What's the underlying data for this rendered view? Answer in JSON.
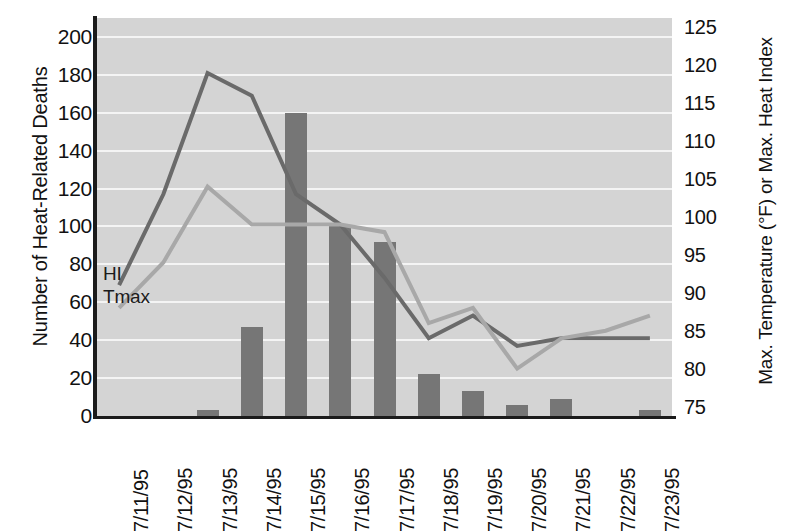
{
  "chart_data": {
    "type": "bar",
    "title": "",
    "categories": [
      "7/11/95",
      "7/12/95",
      "7/13/95",
      "7/14/95",
      "7/15/95",
      "7/16/95",
      "7/17/95",
      "7/18/95",
      "7/19/95",
      "7/20/95",
      "7/21/95",
      "7/22/95",
      "7/23/95"
    ],
    "xlabel": "",
    "ylabel": "Number of Heat-Related Deaths",
    "ylabel_right": "Max. Temperature (°F) or Max. Heat Index",
    "ylim": [
      0,
      210
    ],
    "yticks": [
      0,
      20,
      40,
      60,
      80,
      100,
      120,
      140,
      160,
      180,
      200
    ],
    "ylim_right": [
      73.75,
      126.25
    ],
    "yticks_right": [
      75,
      80,
      85,
      90,
      95,
      100,
      105,
      110,
      115,
      120,
      125
    ],
    "grid": true,
    "legend_position": "inline-annotation",
    "series": [
      {
        "name": "Heat-Related Deaths",
        "type": "bar",
        "axis": "left",
        "color": "#767676",
        "values": [
          0,
          0,
          3,
          47,
          160,
          100,
          92,
          22,
          13,
          6,
          9,
          0,
          3
        ]
      },
      {
        "name": "HI",
        "label": "HI",
        "type": "line",
        "axis": "right",
        "color": "#6a6a6a",
        "values": [
          91,
          103,
          119,
          116,
          103,
          99,
          92,
          84,
          87,
          83,
          84,
          84,
          84
        ]
      },
      {
        "name": "Tmax",
        "label": "Tmax",
        "type": "line",
        "axis": "right",
        "color": "#a8a8a8",
        "values": [
          88,
          94,
          104,
          99,
          99,
          99,
          98,
          86,
          88,
          80,
          84,
          85,
          87
        ]
      }
    ],
    "annotations": [
      {
        "text": "HI",
        "x_index": 0,
        "position": "left-of-line"
      },
      {
        "text": "Tmax",
        "x_index": 0,
        "position": "left-of-line"
      }
    ],
    "colors": {
      "plot_background": "#d4d4d4",
      "gridline": "#f4f4f4",
      "axis": "#1b1b1b",
      "bar": "#767676",
      "hi_line": "#6a6a6a",
      "tmax_line": "#a8a8a8",
      "page_background": "#ffffff"
    }
  }
}
